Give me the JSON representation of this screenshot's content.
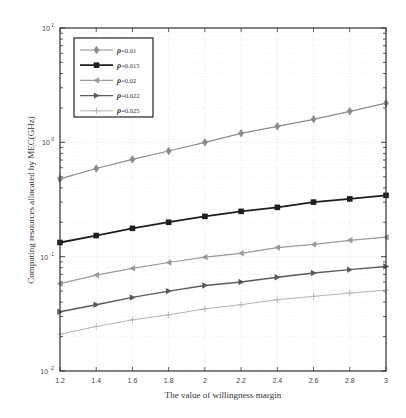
{
  "chart_data": {
    "type": "line",
    "title": "",
    "xlabel": "The value of willingness margin",
    "ylabel": "Computing resources allocated by MEC(GHz)",
    "yscale": "log",
    "xlim": [
      1.2,
      3
    ],
    "ylim": [
      0.01,
      10
    ],
    "grid": true,
    "legend_position": "upper left",
    "x": [
      1.2,
      1.4,
      1.6,
      1.8,
      2.0,
      2.2,
      2.4,
      2.6,
      2.8,
      3.0
    ],
    "x_tick_labels": [
      "1.2",
      "1.4",
      "1.6",
      "1.8",
      "2",
      "2.2",
      "2.4",
      "2.6",
      "2.8",
      "3"
    ],
    "y_tick_labels": [
      {
        "base": "10",
        "exp": "-2",
        "value": 0.01
      },
      {
        "base": "10",
        "exp": "-1",
        "value": 0.1
      },
      {
        "base": "10",
        "exp": "0",
        "value": 1
      },
      {
        "base": "10",
        "exp": "1",
        "value": 10
      }
    ],
    "series": [
      {
        "name": "ρ=0.01",
        "legend_value": "=0.01",
        "marker": "diamond",
        "color": "#8c8c8c",
        "line_width": 1.2,
        "values": [
          0.48,
          0.59,
          0.71,
          0.84,
          1.0,
          1.2,
          1.38,
          1.59,
          1.87,
          2.2
        ]
      },
      {
        "name": "ρ=0.015",
        "legend_value": "=0.015",
        "marker": "square",
        "color": "#1e1e1e",
        "line_width": 1.8,
        "values": [
          0.133,
          0.153,
          0.177,
          0.2,
          0.225,
          0.249,
          0.27,
          0.3,
          0.32,
          0.344
        ]
      },
      {
        "name": "ρ=0.02",
        "legend_value": "=0.02",
        "marker": "triangle-left",
        "color": "#9a9a9a",
        "line_width": 1.2,
        "values": [
          0.058,
          0.069,
          0.079,
          0.089,
          0.099,
          0.107,
          0.12,
          0.128,
          0.139,
          0.148
        ]
      },
      {
        "name": "ρ=0.022",
        "legend_value": "=0.022",
        "marker": "triangle-right",
        "color": "#5a5a5a",
        "line_width": 1.4,
        "values": [
          0.033,
          0.038,
          0.044,
          0.05,
          0.056,
          0.06,
          0.066,
          0.072,
          0.077,
          0.082
        ]
      },
      {
        "name": "ρ=0.025",
        "legend_value": "=0.025",
        "marker": "plus",
        "color": "#b4b4b4",
        "line_width": 1.0,
        "values": [
          0.021,
          0.0245,
          0.028,
          0.031,
          0.035,
          0.038,
          0.042,
          0.045,
          0.048,
          0.051
        ]
      }
    ]
  },
  "legend": {
    "symbol": "ρ"
  }
}
